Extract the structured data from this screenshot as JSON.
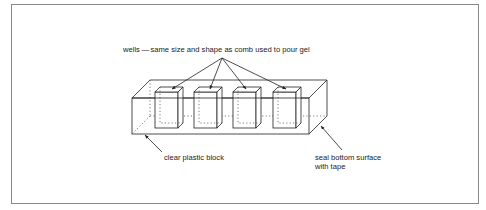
{
  "diagram": {
    "type": "labeled illustration",
    "labels": {
      "wells": "wells — same size and shape as comb used to pour gel",
      "block": "clear plastic block",
      "seal_line1": "seal bottom surface",
      "seal_line2": "with tape"
    },
    "well_count": 4,
    "colors": {
      "line": "#222222",
      "frame": "#8a8a8a",
      "background": "#ffffff"
    }
  }
}
